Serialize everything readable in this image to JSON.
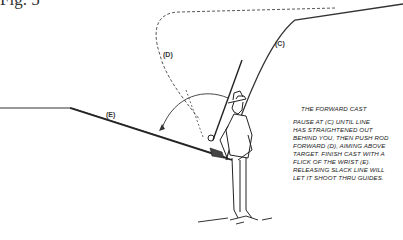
{
  "figure": {
    "label": "Fig. 5"
  },
  "labels": {
    "c": "(C)",
    "d": "(D)",
    "e": "(E)"
  },
  "caption": {
    "title": "THE FORWARD CAST",
    "body": "PAUSE AT (C) UNTIL LINE\nHAS STRAIGHTENED OUT\nBEHIND YOU, THEN PUSH ROD\nFORWARD (D), AIMING ABOVE\nTARGET. FINISH CAST WITH A\nFLICK OF THE WRIST (E).\nRELEASING SLACK LINE WILL\nLET IT SHOOT THRU GUIDES."
  },
  "colors": {
    "ink": "#222222",
    "background": "#ffffff"
  }
}
